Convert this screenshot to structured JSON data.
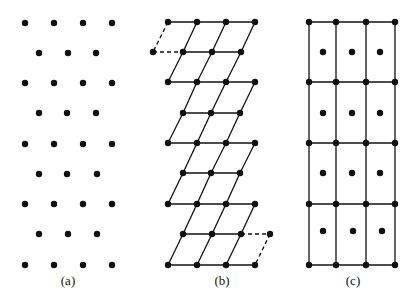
{
  "figure": {
    "width": 417,
    "height": 302,
    "background": "#ffffff",
    "ink": "#111111",
    "dot_radius": 3.2,
    "line_width": 1.3,
    "panels": [
      {
        "id": "a",
        "label": "(a)",
        "label_pos": [
          68,
          285
        ],
        "description": "lattice points only, rows alternating 4 and 3 points",
        "dots": [
          [
            25,
            23
          ],
          [
            54,
            23
          ],
          [
            83,
            23
          ],
          [
            112,
            23
          ],
          [
            39,
            53
          ],
          [
            68,
            53
          ],
          [
            96,
            53
          ],
          [
            25,
            83
          ],
          [
            54,
            83
          ],
          [
            83,
            83
          ],
          [
            112,
            83
          ],
          [
            39,
            113
          ],
          [
            67,
            113
          ],
          [
            96,
            113
          ],
          [
            25,
            144
          ],
          [
            54,
            144
          ],
          [
            83,
            144
          ],
          [
            112,
            144
          ],
          [
            39,
            174
          ],
          [
            67,
            174
          ],
          [
            97,
            174
          ],
          [
            25,
            204
          ],
          [
            54,
            204
          ],
          [
            83,
            204
          ],
          [
            112,
            204
          ],
          [
            39,
            234
          ],
          [
            68,
            234
          ],
          [
            97,
            234
          ],
          [
            25,
            265
          ],
          [
            54,
            265
          ],
          [
            83,
            265
          ],
          [
            112,
            265
          ]
        ],
        "lines": [],
        "dashed_lines": []
      },
      {
        "id": "b",
        "label": "(b)",
        "label_pos": [
          222,
          285
        ],
        "description": "oblique (parallelogram) primitive cells",
        "dots": [
          [
            168,
            22
          ],
          [
            197,
            22
          ],
          [
            226,
            22
          ],
          [
            255,
            22
          ],
          [
            153,
            52
          ],
          [
            183,
            52
          ],
          [
            212,
            52
          ],
          [
            241,
            52
          ],
          [
            168,
            82
          ],
          [
            197,
            82
          ],
          [
            226,
            82
          ],
          [
            255,
            82
          ],
          [
            183,
            113
          ],
          [
            211,
            113
          ],
          [
            240,
            113
          ],
          [
            168,
            143
          ],
          [
            197,
            143
          ],
          [
            226,
            143
          ],
          [
            255,
            143
          ],
          [
            183,
            173
          ],
          [
            211,
            173
          ],
          [
            240,
            173
          ],
          [
            168,
            204
          ],
          [
            197,
            204
          ],
          [
            226,
            204
          ],
          [
            255,
            204
          ],
          [
            183,
            234
          ],
          [
            212,
            234
          ],
          [
            241,
            234
          ],
          [
            270,
            234
          ],
          [
            168,
            265
          ],
          [
            197,
            265
          ],
          [
            226,
            265
          ],
          [
            255,
            265
          ]
        ],
        "lines": [
          [
            168,
            22,
            255,
            22
          ],
          [
            197,
            22,
            183,
            52
          ],
          [
            226,
            22,
            212,
            52
          ],
          [
            255,
            22,
            241,
            52
          ],
          [
            183,
            52,
            241,
            52
          ],
          [
            183,
            52,
            168,
            82
          ],
          [
            212,
            52,
            197,
            82
          ],
          [
            241,
            52,
            226,
            82
          ],
          [
            168,
            82,
            255,
            82
          ],
          [
            197,
            82,
            183,
            113
          ],
          [
            226,
            82,
            211,
            113
          ],
          [
            255,
            82,
            240,
            113
          ],
          [
            183,
            113,
            240,
            113
          ],
          [
            183,
            113,
            168,
            143
          ],
          [
            211,
            113,
            197,
            143
          ],
          [
            240,
            113,
            226,
            143
          ],
          [
            168,
            143,
            255,
            143
          ],
          [
            197,
            143,
            183,
            173
          ],
          [
            226,
            143,
            211,
            173
          ],
          [
            255,
            143,
            240,
            173
          ],
          [
            183,
            173,
            240,
            173
          ],
          [
            183,
            173,
            168,
            204
          ],
          [
            211,
            173,
            197,
            204
          ],
          [
            240,
            173,
            226,
            204
          ],
          [
            168,
            204,
            255,
            204
          ],
          [
            197,
            204,
            183,
            234
          ],
          [
            226,
            204,
            212,
            234
          ],
          [
            255,
            204,
            241,
            234
          ],
          [
            183,
            234,
            241,
            234
          ],
          [
            183,
            234,
            168,
            265
          ],
          [
            212,
            234,
            197,
            265
          ],
          [
            241,
            234,
            226,
            265
          ],
          [
            168,
            265,
            255,
            265
          ]
        ],
        "dashed_lines": [
          [
            168,
            22,
            153,
            52
          ],
          [
            153,
            52,
            183,
            52
          ],
          [
            241,
            234,
            270,
            234
          ],
          [
            270,
            234,
            255,
            265
          ]
        ]
      },
      {
        "id": "c",
        "label": "(c)",
        "label_pos": [
          353,
          285
        ],
        "description": "centered rectangular cells",
        "dots": [
          [
            309,
            22
          ],
          [
            336,
            22
          ],
          [
            366,
            22
          ],
          [
            395,
            22
          ],
          [
            323,
            52
          ],
          [
            352,
            52
          ],
          [
            380,
            52
          ],
          [
            309,
            82
          ],
          [
            336,
            82
          ],
          [
            366,
            82
          ],
          [
            395,
            82
          ],
          [
            323,
            113
          ],
          [
            352,
            113
          ],
          [
            380,
            113
          ],
          [
            309,
            143
          ],
          [
            336,
            143
          ],
          [
            366,
            143
          ],
          [
            395,
            143
          ],
          [
            323,
            173
          ],
          [
            352,
            173
          ],
          [
            380,
            173
          ],
          [
            309,
            204
          ],
          [
            336,
            204
          ],
          [
            366,
            204
          ],
          [
            395,
            204
          ],
          [
            323,
            231
          ],
          [
            353,
            231
          ],
          [
            382,
            231
          ],
          [
            309,
            265
          ],
          [
            336,
            265
          ],
          [
            366,
            265
          ],
          [
            395,
            265
          ]
        ],
        "lines": [
          [
            309,
            22,
            395,
            22
          ],
          [
            309,
            82,
            395,
            82
          ],
          [
            309,
            143,
            395,
            143
          ],
          [
            309,
            204,
            395,
            204
          ],
          [
            309,
            265,
            395,
            265
          ],
          [
            309,
            22,
            309,
            265
          ],
          [
            336,
            22,
            336,
            265
          ],
          [
            366,
            22,
            366,
            265
          ],
          [
            395,
            22,
            395,
            265
          ]
        ],
        "dashed_lines": []
      }
    ]
  }
}
